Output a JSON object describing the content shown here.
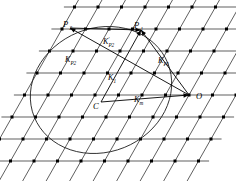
{
  "figure": {
    "name": "reciprocal-lattice-ewald-diagram",
    "background_color": "#ffffff",
    "ink_color": "#1a1a1a",
    "node_color": "#000000",
    "width": 236,
    "height": 181
  },
  "points": {
    "origin": {
      "label": "O",
      "x": 189,
      "y": 95
    },
    "center": {
      "label": "C",
      "x": 101,
      "y": 102
    },
    "p1": {
      "label": "P",
      "sub": "1",
      "x": 141,
      "y": 30
    },
    "p2": {
      "label": "P",
      "sub": "2",
      "x": 70,
      "y": 28
    }
  },
  "vectors": [
    {
      "name": "K_P1",
      "label": "K",
      "sub": "P1",
      "prime": "",
      "label_x": 158,
      "label_y": 63,
      "from": "origin",
      "to": "p1"
    },
    {
      "name": "K_P2",
      "label": "K",
      "sub": "P2",
      "prime": "",
      "label_x": 65,
      "label_y": 62,
      "from": "origin",
      "to": "p2"
    },
    {
      "name": "K_prime_P2",
      "label": "K",
      "sub": "P2",
      "prime": "'",
      "label_x": 103,
      "label_y": 44,
      "from": "p2",
      "to": "p1"
    },
    {
      "name": "K_1",
      "label": "K",
      "sub": "1",
      "prime": "",
      "label_x": 108,
      "label_y": 80,
      "from": "center",
      "to": "p1"
    },
    {
      "name": "K_m",
      "label": "K",
      "sub": "m",
      "prime": "",
      "label_x": 134,
      "label_y": 102,
      "from": "center",
      "to": "origin"
    }
  ],
  "geometry": {
    "lattice": {
      "a_vector": {
        "dx": 23.5,
        "dy": 0
      },
      "b_vector": {
        "dx": -12.5,
        "dy": 22.0
      },
      "origin_x": 189,
      "origin_y": 95,
      "rows": 9,
      "cols": 9
    },
    "ellipse": {
      "cx": 101,
      "cy": 90,
      "rx": 72,
      "ry": 62,
      "rotation_deg": -22
    }
  }
}
